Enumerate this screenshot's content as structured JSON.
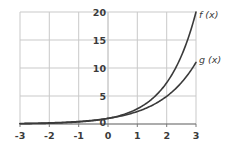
{
  "chart_data": {
    "type": "line",
    "title": "",
    "xlabel": "",
    "ylabel": "",
    "xlim": [
      -3,
      3
    ],
    "ylim": [
      0,
      20
    ],
    "grid": true,
    "legend_position": "inline-right-of-curve-ends",
    "x_ticks": [
      "-3",
      "-2",
      "-1",
      "0",
      "1",
      "2",
      "3"
    ],
    "x_tick_values": [
      -3,
      -2,
      -1,
      0,
      1,
      2,
      3
    ],
    "y_ticks": [
      "0",
      "5",
      "10",
      "15",
      "20"
    ],
    "y_tick_values": [
      0,
      5,
      10,
      15,
      20
    ],
    "series": [
      {
        "name": "f (x)",
        "label": "f (x)",
        "color": "#3a3a3a",
        "x": [
          -3,
          -2.5,
          -2,
          -1.5,
          -1,
          -0.5,
          0,
          0.5,
          1,
          1.5,
          2,
          2.5,
          3
        ],
        "values": [
          0.07,
          0.13,
          0.25,
          0.46,
          0.87,
          1.63,
          1.0,
          1.72,
          2.96,
          5.08,
          8.72,
          13.0,
          20.0
        ]
      },
      {
        "name": "g (x)",
        "label": "g (x)",
        "color": "#3a3a3a",
        "x": [
          -3,
          -2.5,
          -2,
          -1.5,
          -1,
          -0.5,
          0,
          0.5,
          1,
          1.5,
          2,
          2.5,
          3
        ],
        "values": [
          0.08,
          0.15,
          0.27,
          0.48,
          0.87,
          1.54,
          1.0,
          1.66,
          2.4,
          3.7,
          5.5,
          7.9,
          11.0
        ]
      }
    ]
  },
  "axes": {
    "y_tick_labels": [
      {
        "text": "20",
        "value": 20
      },
      {
        "text": "15",
        "value": 15
      },
      {
        "text": "10",
        "value": 10
      },
      {
        "text": "5",
        "value": 5
      },
      {
        "text": "0",
        "value": 0
      }
    ],
    "x_tick_labels": [
      {
        "text": "-3",
        "value": -3
      },
      {
        "text": "-2",
        "value": -2
      },
      {
        "text": "-1",
        "value": -1
      },
      {
        "text": "0",
        "value": 0
      },
      {
        "text": "1",
        "value": 1
      },
      {
        "text": "2",
        "value": 2
      },
      {
        "text": "3",
        "value": 3
      }
    ]
  },
  "labels": {
    "f_curve": "f (x)",
    "g_curve": "g (x)"
  },
  "colors": {
    "background": "#ffffff",
    "grid": "#c9c9c9",
    "axis": "#9a9a9a",
    "x_axis": "#4a4a4a",
    "curve": "#3a3a3a",
    "text": "#3b3b3b"
  }
}
